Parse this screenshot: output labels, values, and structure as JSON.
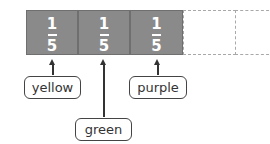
{
  "diagram": {
    "fraction_bar": {
      "filled_parts": [
        {
          "numerator": "1",
          "denominator": "5"
        },
        {
          "numerator": "1",
          "denominator": "5"
        },
        {
          "numerator": "1",
          "denominator": "5"
        }
      ],
      "empty_parts": 2,
      "fill_color": "#8a8a8a"
    },
    "labels": [
      {
        "text": "yellow"
      },
      {
        "text": "green"
      },
      {
        "text": "purple"
      }
    ]
  }
}
